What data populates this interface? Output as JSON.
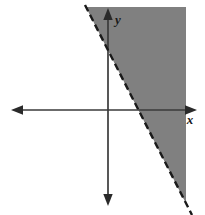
{
  "figure": {
    "name": "linear-inequality-graph",
    "type": "cartesian-plane-with-shaded-halfplane",
    "width": 205,
    "height": 215,
    "background_color": "#ffffff"
  },
  "axes": {
    "x_axis": {
      "label": "x",
      "label_position": {
        "x": 190,
        "y": 124
      },
      "y_pixel": 110,
      "x_start": 12,
      "x_end": 196,
      "arrow_left": true,
      "arrow_right": true,
      "color": "#3a3a3a"
    },
    "y_axis": {
      "label": "y",
      "label_position": {
        "x": 115,
        "y": 24
      },
      "x_pixel": 108,
      "y_start": 9,
      "y_end": 205,
      "arrow_up": true,
      "arrow_down": true,
      "color": "#3a3a3a"
    },
    "origin": {
      "x": 108,
      "y": 110
    }
  },
  "boundary_line": {
    "style": "dashed",
    "color": "#1a1a1a",
    "width": 2.4,
    "dash_pattern": "7 4",
    "start_point": {
      "x": 85,
      "y": 5
    },
    "end_point": {
      "x": 192,
      "y": 215
    },
    "x_intercept_pixel": 139,
    "y_intercept_pixel": 53,
    "slope_sign": "negative"
  },
  "shaded_region": {
    "description": "half-plane to the right of the dashed boundary line",
    "fill_color": "#808080",
    "opacity": 1,
    "clip_box": {
      "left": 86,
      "top": 7,
      "right": 186,
      "bottom": 215
    }
  },
  "colors": {
    "shading": "#808080",
    "line": "#1a1a1a",
    "axis": "#3a3a3a",
    "background": "#ffffff"
  }
}
